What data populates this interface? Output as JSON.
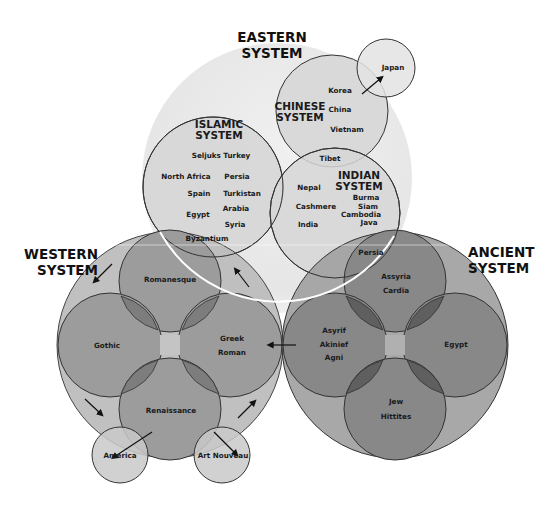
{
  "colors": {
    "eastern_fill": "#ececec",
    "eastern_sub_fill": "#d9d9d9",
    "western_fill": "#bdbdbd",
    "western_sub_fill": "#9c9c9c",
    "western_overlap": "#7d7d7d",
    "ancient_fill": "#a3a3a3",
    "ancient_sub_fill": "#888888",
    "ancient_overlap": "#5f5f5f",
    "outline": "#333333"
  },
  "eastern": {
    "title_line1": "EASTERN",
    "title_line2": "SYSTEM",
    "chinese": {
      "title_line1": "CHINESE",
      "title_line2": "SYSTEM",
      "items": [
        "Korea",
        "China",
        "Vietnam"
      ]
    },
    "japan": "Japan",
    "islamic": {
      "title_line1": "ISLAMIC",
      "title_line2": "SYSTEM",
      "items": [
        "Seljuks Turkey",
        "North Africa",
        "Persia",
        "Spain",
        "Turkistan",
        "Egypt",
        "Arabia",
        "Syria",
        "Byzantium"
      ]
    },
    "tibet": "Tibet",
    "indian": {
      "title_line1": "INDIAN",
      "title_line2": "SYSTEM",
      "items": [
        "Nepal",
        "Cashmere",
        "India",
        "Burma",
        "Siam",
        "Cambodia",
        "Java"
      ]
    }
  },
  "western": {
    "title_line1": "WESTERN",
    "title_line2": "SYSTEM",
    "items": [
      "Romanesque",
      "Gothic",
      "Greek",
      "Roman",
      "Renaissance",
      "America",
      "Art Nouveau"
    ]
  },
  "ancient": {
    "title_line1": "ANCIENT",
    "title_line2": "SYSTEM",
    "items": [
      "Persia",
      "Assyria",
      "Cardia",
      "Asyrif",
      "Akinief",
      "Agni",
      "Egypt",
      "Jew",
      "Hittites"
    ]
  }
}
